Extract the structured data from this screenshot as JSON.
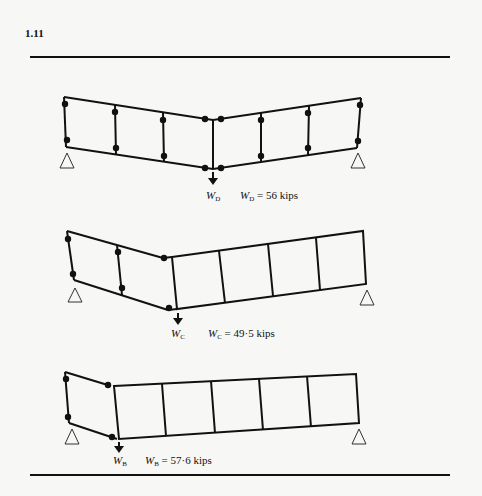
{
  "page": {
    "section_number": "1.11"
  },
  "figures": [
    {
      "id": "mechanism-D",
      "load_symbol": "W",
      "load_subscript": "D",
      "equation_lhs": "W",
      "equation_sub": "D",
      "equation_rhs": "= 56 kips",
      "value_kips": 56
    },
    {
      "id": "mechanism-C",
      "load_symbol": "W",
      "load_subscript": "C",
      "equation_lhs": "W",
      "equation_sub": "C",
      "equation_rhs": "= 49·5 kips",
      "value_kips": 49.5
    },
    {
      "id": "mechanism-B",
      "load_symbol": "W",
      "load_subscript": "B",
      "equation_lhs": "W",
      "equation_sub": "B",
      "equation_rhs": "= 57·6 kips",
      "value_kips": 57.6
    }
  ]
}
